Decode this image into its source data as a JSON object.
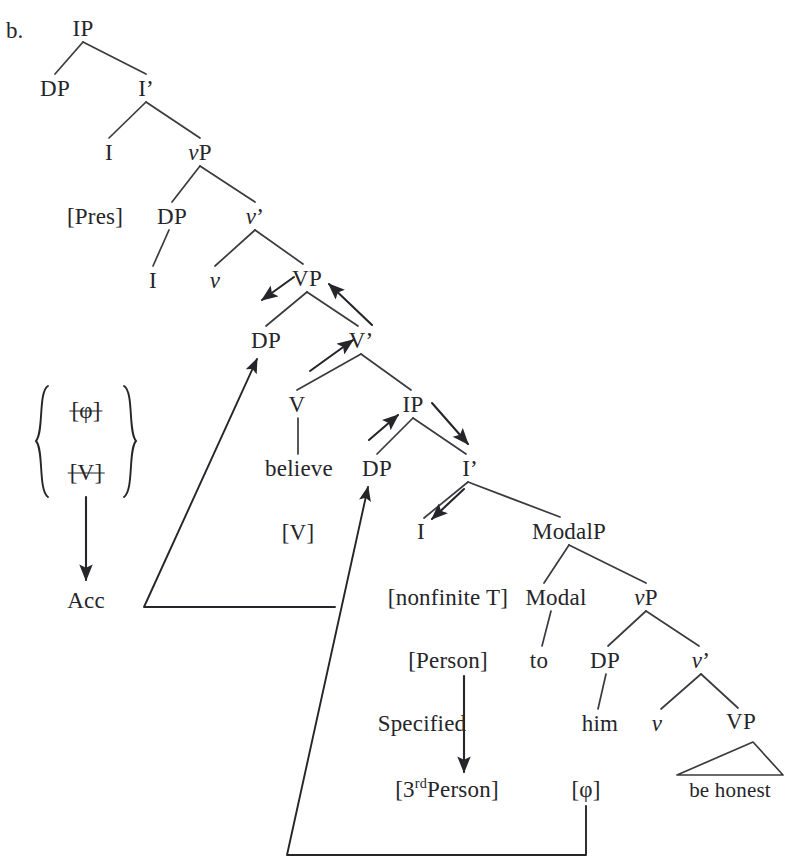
{
  "figure": {
    "enumeration_label": "b."
  },
  "tree": {
    "nodes": [
      {
        "id": "ip-top",
        "label": "IP",
        "x": 83,
        "y": 28,
        "style": "plain"
      },
      {
        "id": "dp-subj",
        "label": "DP",
        "x": 55,
        "y": 88,
        "style": "plain"
      },
      {
        "id": "ibar-top",
        "label": "I’",
        "x": 146,
        "y": 88,
        "style": "plain"
      },
      {
        "id": "i-top",
        "label": "I",
        "x": 109,
        "y": 152,
        "style": "plain"
      },
      {
        "id": "vp-little-top",
        "label": "vP",
        "x": 200,
        "y": 152,
        "style": "ital-first"
      },
      {
        "id": "pres-feature",
        "label": "[Pres]",
        "x": 95,
        "y": 216,
        "style": "plain"
      },
      {
        "id": "dp-spec-vp",
        "label": "DP",
        "x": 172,
        "y": 216,
        "style": "plain"
      },
      {
        "id": "vbar-little",
        "label": "v’",
        "x": 255,
        "y": 216,
        "style": "ital-first"
      },
      {
        "id": "i-under-dp",
        "label": "I",
        "x": 153,
        "y": 280,
        "style": "plain"
      },
      {
        "id": "v-little",
        "label": "v",
        "x": 215,
        "y": 280,
        "style": "ital-first"
      },
      {
        "id": "vp-big",
        "label": "VP",
        "x": 307,
        "y": 278,
        "style": "plain"
      },
      {
        "id": "dp-obj",
        "label": "DP",
        "x": 266,
        "y": 340,
        "style": "plain"
      },
      {
        "id": "vbar-big",
        "label": "V’",
        "x": 361,
        "y": 340,
        "style": "plain"
      },
      {
        "id": "v-head",
        "label": "V",
        "x": 297,
        "y": 404,
        "style": "plain"
      },
      {
        "id": "ip-embedded",
        "label": "IP",
        "x": 413,
        "y": 404,
        "style": "plain"
      },
      {
        "id": "believe",
        "label": "believe",
        "x": 299,
        "y": 468,
        "style": "plain"
      },
      {
        "id": "dp-ecm",
        "label": "DP",
        "x": 377,
        "y": 468,
        "style": "plain"
      },
      {
        "id": "ibar-emb",
        "label": "I’",
        "x": 470,
        "y": 468,
        "style": "plain"
      },
      {
        "id": "v-feature",
        "label": "[V]",
        "x": 298,
        "y": 532,
        "style": "plain"
      },
      {
        "id": "i-emb",
        "label": "I",
        "x": 421,
        "y": 531,
        "style": "plain"
      },
      {
        "id": "modalp",
        "label": "ModalP",
        "x": 569,
        "y": 531,
        "style": "plain"
      },
      {
        "id": "nonfinite-t",
        "label": "[nonfinite T]",
        "x": 448,
        "y": 597,
        "style": "plain"
      },
      {
        "id": "modal",
        "label": "Modal",
        "x": 556,
        "y": 597,
        "style": "plain"
      },
      {
        "id": "vp-little-emb",
        "label": "vP",
        "x": 646,
        "y": 597,
        "style": "ital-first"
      },
      {
        "id": "person-feat",
        "label": "[Person]",
        "x": 448,
        "y": 660,
        "style": "plain"
      },
      {
        "id": "to",
        "label": "to",
        "x": 539,
        "y": 660,
        "style": "plain"
      },
      {
        "id": "dp-him",
        "label": "DP",
        "x": 605,
        "y": 660,
        "style": "plain"
      },
      {
        "id": "vbar-emb",
        "label": "v’",
        "x": 701,
        "y": 660,
        "style": "ital-first"
      },
      {
        "id": "specified",
        "label": "Specified",
        "x": 422,
        "y": 723,
        "style": "plain"
      },
      {
        "id": "him",
        "label": "him",
        "x": 600,
        "y": 723,
        "style": "plain"
      },
      {
        "id": "v-little-emb",
        "label": "v",
        "x": 657,
        "y": 723,
        "style": "ital-first"
      },
      {
        "id": "vp-final",
        "label": "VP",
        "x": 741,
        "y": 721,
        "style": "plain"
      },
      {
        "id": "third-person",
        "label": "[3rdPerson]",
        "x": 447,
        "y": 789,
        "style": "superscript-rd"
      },
      {
        "id": "phi-feature",
        "label": "[φ]",
        "x": 586,
        "y": 789,
        "style": "plain"
      },
      {
        "id": "be-honest",
        "label": "be honest",
        "x": 730,
        "y": 790,
        "style": "plain"
      }
    ],
    "case_box": {
      "struck_items": [
        {
          "id": "struck-phi",
          "label": "[φ]",
          "x": 86,
          "y": 410
        },
        {
          "id": "struck-v",
          "label": "[V]",
          "x": 86,
          "y": 472
        }
      ],
      "result": {
        "id": "acc-result",
        "label": "Acc",
        "x": 86,
        "y": 600
      }
    },
    "colors": {
      "ink": "#25252a",
      "line": "#3a3a40",
      "background": "#ffffff"
    }
  }
}
